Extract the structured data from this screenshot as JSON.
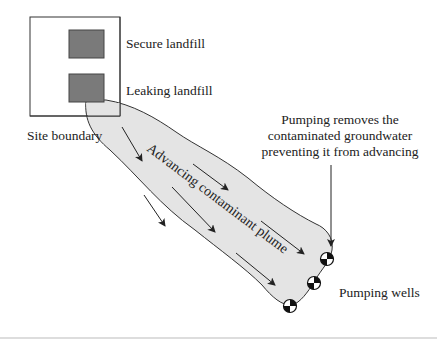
{
  "diagram": {
    "labels": {
      "secure_landfill": "Secure landfill",
      "leaking_landfill": "Leaking landfill",
      "site_boundary": "Site boundary",
      "plume": "Advancing contaminant plume",
      "pumping_note_line1": "Pumping removes the",
      "pumping_note_line2": "contaminated groundwater",
      "pumping_note_line3": "preventing it from advancing",
      "pumping_wells": "Pumping wells"
    },
    "colors": {
      "landfill_fill": "#7a7a7a",
      "plume_fill": "#e4e4e4",
      "line": "#333333",
      "background": "#ffffff"
    },
    "elements": {
      "landfill_count": 2,
      "well_count": 3,
      "flow_arrow_count": 7
    }
  }
}
